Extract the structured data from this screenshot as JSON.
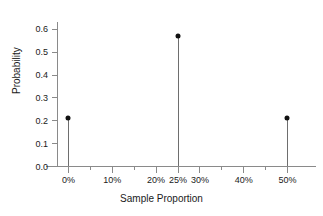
{
  "chart_data": {
    "type": "scatter",
    "title": "",
    "subtitle": "",
    "xlabel": "Sample Proportion",
    "ylabel": "Probability",
    "xlim": [
      -2.5,
      55
    ],
    "ylim": [
      0.0,
      0.63
    ],
    "grid": false,
    "legend": null,
    "x_unit": "%",
    "x": [
      0,
      25,
      50
    ],
    "values": [
      0.21,
      0.57,
      0.21
    ],
    "points": [
      {
        "x": 0,
        "x_label": "0%",
        "y": 0.21
      },
      {
        "x": 25,
        "x_label": "25%",
        "y": 0.57
      },
      {
        "x": 50,
        "x_label": "50%",
        "y": 0.21
      }
    ],
    "x_major_ticks": [
      {
        "value": 0,
        "label": "0%"
      },
      {
        "value": 10,
        "label": "10%"
      },
      {
        "value": 20,
        "label": "20%"
      },
      {
        "value": 25,
        "label": "25%"
      },
      {
        "value": 30,
        "label": "30%"
      },
      {
        "value": 40,
        "label": "40%"
      },
      {
        "value": 50,
        "label": "50%"
      }
    ],
    "x_minor_ticks": [
      5,
      15,
      35,
      45
    ],
    "y_ticks": [
      {
        "value": 0.0,
        "label": "0.0"
      },
      {
        "value": 0.1,
        "label": "0.1"
      },
      {
        "value": 0.2,
        "label": "0.2"
      },
      {
        "value": 0.3,
        "label": "0.3"
      },
      {
        "value": 0.4,
        "label": "0.4"
      },
      {
        "value": 0.5,
        "label": "0.5"
      },
      {
        "value": 0.6,
        "label": "0.6"
      }
    ],
    "colors": {
      "marker": "#111111",
      "stem": "#6e6e6e",
      "axis": "#8a8a8a",
      "text": "#1a1a1a",
      "background": "#ffffff"
    }
  }
}
